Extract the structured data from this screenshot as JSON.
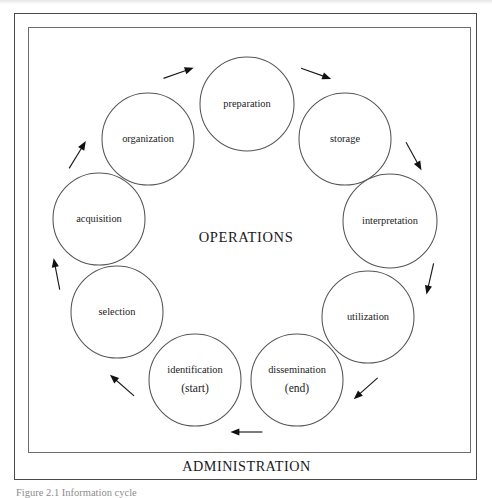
{
  "figure": {
    "center_label": "OPERATIONS",
    "bottom_label": "ADMINISTRATION",
    "caption": "Figure 2.1  Information cycle",
    "frame_color": "#4a4a4a",
    "circle_stroke_color": "#555555",
    "arrow_color": "#111111",
    "background_color": "#ffffff"
  },
  "chart_data": {
    "type": "diagram",
    "diagram_kind": "cycle",
    "title": "OPERATIONS",
    "footer": "ADMINISTRATION",
    "direction": "clockwise",
    "start_node": "identification",
    "end_node": "dissemination",
    "nodes": [
      {
        "id": "preparation",
        "label": "preparation",
        "sublabel": "",
        "cx": 247,
        "cy": 104,
        "r": 47,
        "order": 3
      },
      {
        "id": "storage",
        "label": "storage",
        "sublabel": "",
        "cx": 345,
        "cy": 139,
        "r": 46,
        "order": 4
      },
      {
        "id": "interpretation",
        "label": "interpretation",
        "sublabel": "",
        "cx": 390,
        "cy": 221,
        "r": 47,
        "order": 5
      },
      {
        "id": "utilization",
        "label": "utilization",
        "sublabel": "",
        "cx": 368,
        "cy": 317,
        "r": 46,
        "order": 6
      },
      {
        "id": "dissemination",
        "label": "dissemination",
        "sublabel": "(end)",
        "cx": 297,
        "cy": 380,
        "r": 46,
        "order": 7
      },
      {
        "id": "identification",
        "label": "identification",
        "sublabel": "(start)",
        "cx": 195,
        "cy": 380,
        "r": 46,
        "order": 0
      },
      {
        "id": "selection",
        "label": "selection",
        "sublabel": "",
        "cx": 117,
        "cy": 312,
        "r": 46,
        "order": 1
      },
      {
        "id": "acquisition",
        "label": "acquisition",
        "sublabel": "",
        "cx": 99,
        "cy": 219,
        "r": 46,
        "order": 2
      },
      {
        "id": "organization",
        "label": "organization",
        "sublabel": "",
        "cx": 148,
        "cy": 139,
        "r": 46,
        "order": 2.5
      }
    ],
    "edges": [
      {
        "from": "dissemination",
        "to": "identification",
        "label": ""
      },
      {
        "from": "identification",
        "to": "selection",
        "label": ""
      },
      {
        "from": "selection",
        "to": "acquisition",
        "label": ""
      },
      {
        "from": "acquisition",
        "to": "organization",
        "label": ""
      },
      {
        "from": "organization",
        "to": "preparation",
        "label": ""
      },
      {
        "from": "preparation",
        "to": "storage",
        "label": ""
      },
      {
        "from": "storage",
        "to": "interpretation",
        "label": ""
      },
      {
        "from": "interpretation",
        "to": "utilization",
        "label": ""
      },
      {
        "from": "utilization",
        "to": "dissemination",
        "label": ""
      }
    ]
  }
}
